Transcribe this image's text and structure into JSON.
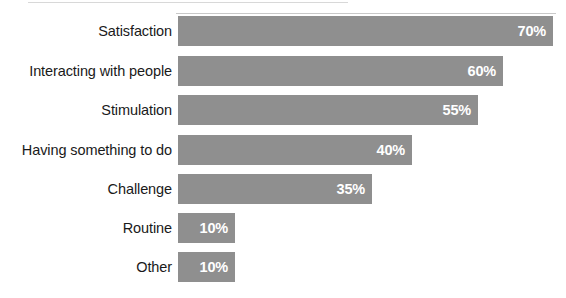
{
  "chart_data": {
    "type": "bar",
    "orientation": "horizontal",
    "title": "",
    "subtitle": "",
    "xlabel": "",
    "ylabel": "",
    "xlim": [
      0,
      70
    ],
    "grid": false,
    "legend": false,
    "value_suffix": "%",
    "categories": [
      "Satisfaction",
      "Interacting with people",
      "Stimulation",
      "Having something to do",
      "Challenge",
      "Routine",
      "Other"
    ],
    "values": [
      70,
      60,
      55,
      40,
      35,
      10,
      10
    ],
    "value_labels": [
      "70%",
      "60%",
      "55%",
      "40%",
      "35%",
      "10%",
      "10%"
    ],
    "colors": {
      "bar_fill": "#8f8f8f",
      "value_text": "#ffffff",
      "category_text": "#1a1a1a",
      "background": "#ffffff"
    },
    "bars": [
      {
        "label": "Satisfaction",
        "value": 70,
        "value_label": "70%",
        "bar_px": 375,
        "top_px": 16
      },
      {
        "label": "Interacting with people",
        "value": 60,
        "value_label": "60%",
        "bar_px": 325,
        "top_px": 56
      },
      {
        "label": "Stimulation",
        "value": 55,
        "value_label": "55%",
        "bar_px": 300,
        "top_px": 95
      },
      {
        "label": "Having something to do",
        "value": 40,
        "value_label": "40%",
        "bar_px": 234,
        "top_px": 135
      },
      {
        "label": "Challenge",
        "value": 35,
        "value_label": "35%",
        "bar_px": 194,
        "top_px": 174
      },
      {
        "label": "Routine",
        "value": 10,
        "value_label": "10%",
        "bar_px": 57,
        "top_px": 213
      },
      {
        "label": "Other",
        "value": 10,
        "value_label": "10%",
        "bar_px": 57,
        "top_px": 252
      }
    ]
  }
}
